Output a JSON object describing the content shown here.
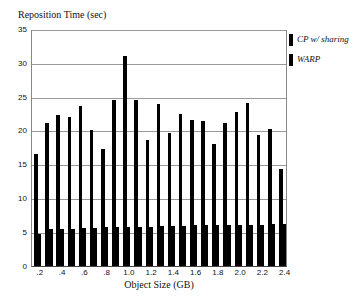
{
  "chart_data": {
    "type": "bar",
    "title": "",
    "ylabel": "Reposition Time (sec)",
    "xlabel": "Object Size (GB)",
    "ylim": [
      0,
      35
    ],
    "yticks": [
      0,
      5,
      10,
      15,
      20,
      25,
      30,
      35
    ],
    "xtick_labels": [
      ".2",
      ".4",
      ".6",
      ".8",
      "1.0",
      "1.2",
      "1.4",
      "1.6",
      "1.8",
      "2.0",
      "2.2",
      "2.4"
    ],
    "grid": true,
    "legend_position": "right",
    "x": [
      0.2,
      0.3,
      0.4,
      0.5,
      0.6,
      0.7,
      0.8,
      0.9,
      1.0,
      1.1,
      1.2,
      1.3,
      1.4,
      1.5,
      1.6,
      1.7,
      1.8,
      1.9,
      2.0,
      2.1,
      2.2,
      2.3,
      2.4
    ],
    "series": [
      {
        "name": "CP w/ sharing",
        "values": [
          16.5,
          21.2,
          22.3,
          22.1,
          23.7,
          20.1,
          17.3,
          24.5,
          31.0,
          24.5,
          18.6,
          23.9,
          19.7,
          22.5,
          21.6,
          21.5,
          18.1,
          21.1,
          22.7,
          24.1,
          19.3,
          20.3,
          14.3
        ]
      },
      {
        "name": "WARP",
        "values": [
          4.7,
          5.4,
          5.5,
          5.5,
          5.6,
          5.6,
          5.7,
          5.7,
          5.8,
          5.8,
          5.8,
          5.9,
          5.9,
          5.9,
          6.0,
          6.0,
          6.0,
          6.1,
          6.1,
          6.1,
          6.1,
          6.2,
          6.2
        ]
      }
    ]
  }
}
